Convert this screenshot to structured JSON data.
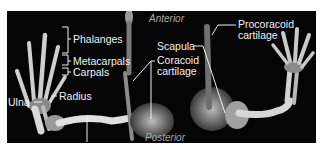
{
  "figure": {
    "orientation": {
      "top": "Anterior",
      "bottom": "Posterior"
    },
    "labels": {
      "phalanges": "Phalanges",
      "metacarpals": "Metacarpals",
      "carpals": "Carpals",
      "radius": "Radius",
      "ulna": "Ulna",
      "humerus": "Humerus",
      "scapula": "Scapula",
      "coracoid_line1": "Coracoid",
      "coracoid_line2": "cartilage",
      "procoracoid_line1": "Procoracoid",
      "procoracoid_line2": "cartilage"
    },
    "colors": {
      "background": "#050505",
      "bone": "#d8d8d8",
      "label": "#f2f2f2",
      "orientation_text": "#a8a8a8"
    }
  }
}
